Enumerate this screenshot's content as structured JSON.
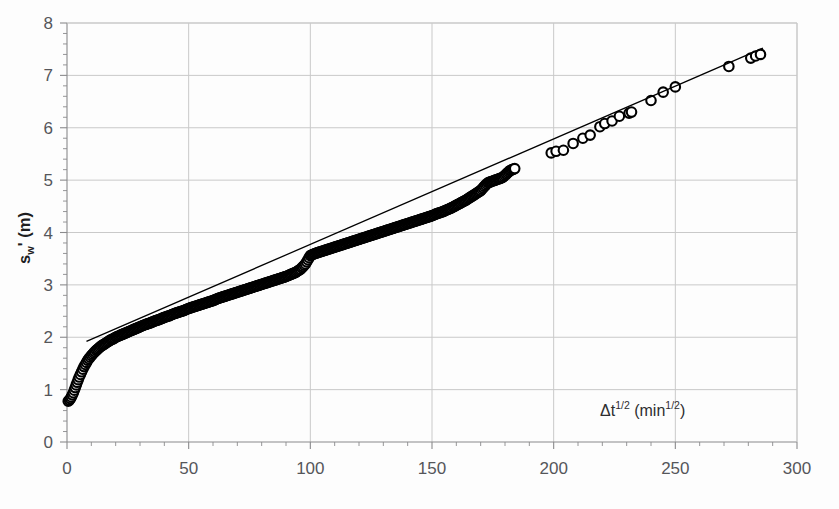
{
  "figure": {
    "background_color": "#fdfdfd",
    "ink_color": "#000000",
    "gridline_color": "#c9c9c9",
    "axis_color": "#8a8a8c",
    "tick_label_color": "#55565a"
  },
  "axes": {
    "y": {
      "label_parts": {
        "base": "s",
        "subscript": "w",
        "prime": "'",
        "unit": " (m)"
      },
      "label_text": "s_w' (m)",
      "min": 0,
      "max": 8,
      "major_step": 1,
      "minor_step": 0.2,
      "tick_labels": [
        "0",
        "1",
        "2",
        "3",
        "4",
        "5",
        "6",
        "7",
        "8"
      ],
      "tick_values": [
        0,
        1,
        2,
        3,
        4,
        5,
        6,
        7,
        8
      ],
      "grid": true
    },
    "x": {
      "label_parts": {
        "delta": "Δ",
        "base": "t",
        "exponent": "1/2",
        "open_paren": " (min",
        "unit_exponent": "1/2",
        "close_paren": ")"
      },
      "label_text": "Δt^1/2 (min^1/2)",
      "min": 0,
      "max": 300,
      "major_step": 50,
      "minor_step": 10,
      "tick_labels": [
        "0",
        "50",
        "100",
        "150",
        "200",
        "250",
        "300"
      ],
      "tick_values": [
        0,
        50,
        100,
        150,
        200,
        250,
        300
      ],
      "grid": true
    }
  },
  "chart_data": {
    "type": "scatter",
    "title": "",
    "subtitle": "",
    "xlabel": "Δt^1/2 (min^1/2)",
    "ylabel": "s_w' (m)",
    "xlim": [
      0,
      300
    ],
    "ylim": [
      0,
      8
    ],
    "grid": true,
    "legend": null,
    "marker": {
      "style": "open-circle",
      "size_px": 9.5,
      "edge_color": "#000000",
      "face_color": "#ffffff"
    },
    "series": [
      {
        "name": "s_w' observations",
        "type": "scatter",
        "marker": "open-circle",
        "note": "Dense overlapping markers form a solid band for x<172; discrete markers beyond.",
        "points": [
          [
            0.5,
            0.78
          ],
          [
            1.0,
            0.8
          ],
          [
            1.4,
            0.83
          ],
          [
            1.8,
            0.86
          ],
          [
            2.2,
            0.9
          ],
          [
            2.6,
            0.94
          ],
          [
            3.0,
            0.99
          ],
          [
            3.4,
            1.04
          ],
          [
            3.8,
            1.09
          ],
          [
            4.2,
            1.14
          ],
          [
            4.6,
            1.19
          ],
          [
            5.0,
            1.24
          ],
          [
            5.5,
            1.29
          ],
          [
            6.0,
            1.34
          ],
          [
            6.5,
            1.39
          ],
          [
            7.0,
            1.44
          ],
          [
            7.5,
            1.48
          ],
          [
            8.0,
            1.52
          ],
          [
            8.5,
            1.56
          ],
          [
            9.0,
            1.59
          ],
          [
            9.5,
            1.62
          ],
          [
            10.0,
            1.65
          ],
          [
            11.0,
            1.7
          ],
          [
            12.0,
            1.75
          ],
          [
            13.0,
            1.79
          ],
          [
            14.0,
            1.83
          ],
          [
            15.0,
            1.86
          ],
          [
            16.0,
            1.89
          ],
          [
            17.0,
            1.92
          ],
          [
            18.0,
            1.95
          ],
          [
            19.0,
            1.97
          ],
          [
            20.0,
            2.0
          ],
          [
            22.0,
            2.04
          ],
          [
            24.0,
            2.08
          ],
          [
            26.0,
            2.12
          ],
          [
            28.0,
            2.16
          ],
          [
            30.0,
            2.2
          ],
          [
            32.0,
            2.24
          ],
          [
            34.0,
            2.27
          ],
          [
            36.0,
            2.31
          ],
          [
            38.0,
            2.34
          ],
          [
            40.0,
            2.38
          ],
          [
            42.0,
            2.41
          ],
          [
            44.0,
            2.45
          ],
          [
            46.0,
            2.48
          ],
          [
            48.0,
            2.51
          ],
          [
            50.0,
            2.55
          ],
          [
            52.0,
            2.58
          ],
          [
            54.0,
            2.61
          ],
          [
            56.0,
            2.64
          ],
          [
            58.0,
            2.67
          ],
          [
            60.0,
            2.7
          ],
          [
            62.0,
            2.74
          ],
          [
            64.0,
            2.77
          ],
          [
            66.0,
            2.8
          ],
          [
            68.0,
            2.83
          ],
          [
            70.0,
            2.86
          ],
          [
            72.0,
            2.89
          ],
          [
            74.0,
            2.92
          ],
          [
            76.0,
            2.95
          ],
          [
            78.0,
            2.98
          ],
          [
            80.0,
            3.01
          ],
          [
            82.0,
            3.04
          ],
          [
            84.0,
            3.07
          ],
          [
            86.0,
            3.1
          ],
          [
            88.0,
            3.13
          ],
          [
            90.0,
            3.16
          ],
          [
            92.0,
            3.2
          ],
          [
            94.0,
            3.24
          ],
          [
            96.0,
            3.3
          ],
          [
            98.0,
            3.4
          ],
          [
            100.0,
            3.56
          ],
          [
            102.0,
            3.6
          ],
          [
            104.0,
            3.63
          ],
          [
            106.0,
            3.66
          ],
          [
            108.0,
            3.69
          ],
          [
            110.0,
            3.72
          ],
          [
            112.0,
            3.75
          ],
          [
            114.0,
            3.78
          ],
          [
            116.0,
            3.81
          ],
          [
            118.0,
            3.84
          ],
          [
            120.0,
            3.87
          ],
          [
            122.0,
            3.9
          ],
          [
            124.0,
            3.93
          ],
          [
            126.0,
            3.96
          ],
          [
            128.0,
            3.99
          ],
          [
            130.0,
            4.02
          ],
          [
            132.0,
            4.05
          ],
          [
            134.0,
            4.08
          ],
          [
            136.0,
            4.11
          ],
          [
            138.0,
            4.14
          ],
          [
            140.0,
            4.17
          ],
          [
            142.0,
            4.2
          ],
          [
            144.0,
            4.23
          ],
          [
            146.0,
            4.26
          ],
          [
            148.0,
            4.29
          ],
          [
            150.0,
            4.32
          ],
          [
            152.0,
            4.36
          ],
          [
            154.0,
            4.39
          ],
          [
            156.0,
            4.43
          ],
          [
            158.0,
            4.47
          ],
          [
            160.0,
            4.52
          ],
          [
            162.0,
            4.57
          ],
          [
            164.0,
            4.62
          ],
          [
            166.0,
            4.68
          ],
          [
            168.0,
            4.74
          ],
          [
            170.0,
            4.8
          ],
          [
            171.5,
            4.88
          ],
          [
            173.0,
            4.95
          ],
          [
            176.0,
            5.0
          ],
          [
            179.0,
            5.05
          ],
          [
            182.0,
            5.18
          ],
          [
            184.0,
            5.22
          ],
          [
            199.0,
            5.52
          ],
          [
            201.0,
            5.55
          ],
          [
            204.0,
            5.57
          ],
          [
            208.0,
            5.7
          ],
          [
            212.0,
            5.8
          ],
          [
            215.0,
            5.86
          ],
          [
            219.0,
            6.02
          ],
          [
            221.0,
            6.08
          ],
          [
            224.0,
            6.13
          ],
          [
            227.0,
            6.22
          ],
          [
            231.0,
            6.28
          ],
          [
            232.0,
            6.3
          ],
          [
            240.0,
            6.52
          ],
          [
            245.0,
            6.68
          ],
          [
            250.0,
            6.78
          ],
          [
            272.0,
            7.17
          ],
          [
            281.0,
            7.33
          ],
          [
            283.0,
            7.37
          ],
          [
            285.0,
            7.4
          ]
        ]
      },
      {
        "name": "fitted straight line",
        "type": "line",
        "note": "Straight regression line drawn over the linear portion of the curve.",
        "x_start": 8.0,
        "y_start": 1.92,
        "x_end": 286.0,
        "y_end": 7.52,
        "slope": 0.02014,
        "intercept": 1.759,
        "color": "#000000",
        "width_px": 1.3
      }
    ]
  }
}
